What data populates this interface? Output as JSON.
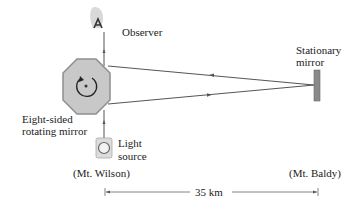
{
  "labels": {
    "observer": "Observer",
    "stationary_mirror_line1": "Stationary",
    "stationary_mirror_line2": "mirror",
    "rotating_mirror_line1": "Eight-sided",
    "rotating_mirror_line2": "rotating mirror",
    "light_source_line1": "Light",
    "light_source_line2": "source",
    "left_site": "(Mt. Wilson)",
    "right_site": "(Mt. Baldy)",
    "distance": "35 km"
  },
  "colors": {
    "octagon_fill": "#c8c8c8",
    "octagon_stroke": "#8f8f8f",
    "beam": "#555555",
    "mirror_fill": "#8a8a8a",
    "text": "#222222"
  }
}
